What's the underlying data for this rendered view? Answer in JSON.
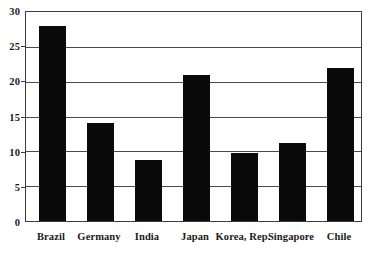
{
  "chart_data": {
    "type": "bar",
    "title": "",
    "subtitle": "",
    "xlabel": "",
    "ylabel": "",
    "ylim": [
      0,
      30
    ],
    "yticks": [
      0,
      5,
      10,
      15,
      20,
      25,
      30
    ],
    "ytick_labels": [
      "0",
      "5",
      "10",
      "15",
      "20",
      "25",
      "30"
    ],
    "grid": true,
    "legend": false,
    "legend_position": "none",
    "bar_color": "#0a0a0a",
    "categories": [
      "Brazil",
      "Germany",
      "India",
      "Japan",
      "Korea, Rep.",
      "Singapore",
      "Chile"
    ],
    "values": [
      28,
      14,
      8.8,
      21,
      9.8,
      11.2,
      22
    ],
    "series": [
      {
        "name": "",
        "values": [
          28,
          14,
          8.8,
          21,
          9.8,
          11.2,
          22
        ]
      }
    ],
    "annotations": []
  },
  "axes": {
    "y_tick_labels": [
      "30",
      "25",
      "20",
      "15",
      "10",
      "5",
      "0"
    ],
    "x_tick_labels": [
      "Brazil",
      "Germany",
      "India",
      "Japan",
      "Korea, Rep.",
      "Singapore",
      "Chile"
    ]
  },
  "style": {
    "frame_color": "#3b3b3b",
    "gridline_color": "#4a4a4a",
    "background": "#ffffff",
    "text_color": "#1a1a1a"
  }
}
